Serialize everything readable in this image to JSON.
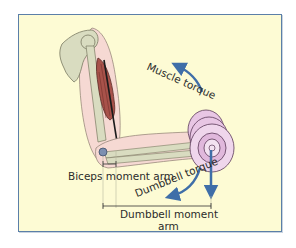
{
  "figure": {
    "type": "anatomical lever diagram",
    "colors": {
      "background": "#fdfbd4",
      "frame_border": "#5b7fa8",
      "arrow": "#3f6ea8",
      "bone": "#d9dcc0",
      "skin": "#f6d9d3",
      "muscle": "#a8524a",
      "dumbbell": "#e8c6e4"
    }
  },
  "labels": {
    "muscle_torque": "Muscle torque",
    "dumbbell_torque": "Dumbbell torque",
    "biceps_moment_arm": "Biceps moment arm",
    "dumbbell_moment_arm_line1": "Dumbbell moment",
    "dumbbell_moment_arm_line2": "arm"
  },
  "elements": {
    "arrows": [
      {
        "name": "muscle-torque-arrow",
        "direction": "counter-clockwise (upward)"
      },
      {
        "name": "dumbbell-torque-arrow",
        "direction": "clockwise (downward)"
      },
      {
        "name": "dumbbell-weight-arrow",
        "direction": "straight down"
      }
    ],
    "brackets": [
      {
        "name": "biceps-moment-arm-bracket",
        "from": "elbow joint",
        "to": "biceps insertion"
      },
      {
        "name": "dumbbell-moment-arm-bracket",
        "from": "elbow joint",
        "to": "dumbbell center"
      }
    ]
  }
}
